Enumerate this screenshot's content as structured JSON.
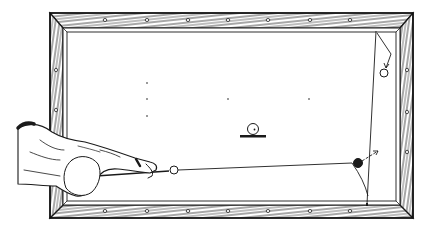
{
  "figure": {
    "title": "Billiards table shot illustration",
    "colors": {
      "ink": "#1a1a1a",
      "paper": "#ffffff",
      "wood": "#2b2b2b"
    }
  },
  "table": {
    "outer_frame": {
      "x": 50,
      "y": 13,
      "w": 363,
      "h": 205
    },
    "cushion_line": {
      "x": 63,
      "y": 28,
      "w": 337,
      "h": 177
    },
    "surface": {
      "x": 66,
      "y": 31,
      "w": 331,
      "h": 171
    },
    "diamonds": {
      "top": [
        105,
        147,
        188,
        228,
        268,
        310,
        350
      ],
      "bottom": [
        105,
        147,
        188,
        228,
        268,
        310,
        350
      ],
      "left": [
        70,
        110,
        150
      ],
      "right": [
        70,
        112,
        152
      ]
    },
    "spots": [
      {
        "x": 147,
        "y": 83
      },
      {
        "x": 147,
        "y": 99
      },
      {
        "x": 147,
        "y": 116
      },
      {
        "x": 228,
        "y": 99
      },
      {
        "x": 309,
        "y": 99
      }
    ]
  },
  "balls": [
    {
      "id": "cue-ball",
      "x": 174,
      "y": 170,
      "r": 4,
      "fill": "hollow"
    },
    {
      "id": "object-ball-black",
      "x": 358,
      "y": 163,
      "r": 4.5,
      "fill": "solid"
    },
    {
      "id": "object-ball-corner",
      "x": 384,
      "y": 73,
      "r": 4,
      "fill": "hollow"
    },
    {
      "id": "legend-ball-on-base",
      "x": 253,
      "y": 129,
      "r": 5.5,
      "fill": "hollow"
    }
  ],
  "paths": {
    "cue_stick": {
      "x1": 96,
      "y1": 176,
      "x2": 169,
      "y2": 171
    },
    "cue_ball_path": "M178,170 L352,163 Q364,180 368,196",
    "object_ball_direction": {
      "x1": 362,
      "y1": 161,
      "x2": 378,
      "y2": 151
    },
    "long_rail_line": {
      "x1": 376,
      "y1": 31,
      "x2": 367,
      "y2": 204
    },
    "corner_ball_zigzag": "M377,33 L391,54 L386,68"
  }
}
